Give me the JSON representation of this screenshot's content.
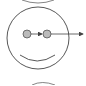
{
  "diagram": {
    "colors": {
      "stroke": "#444444",
      "eye_fill": "#bbbbbb",
      "background": "#ffffff"
    },
    "face": {
      "cx": 38,
      "cy": 38,
      "r": 31
    },
    "eyes": [
      {
        "cx": 27,
        "cy": 34,
        "r": 4
      },
      {
        "cx": 47,
        "cy": 34,
        "r": 4
      }
    ],
    "arrows": [
      {
        "from": "left-eye",
        "to": "right-eye"
      },
      {
        "from": "right-eye",
        "to": "right-edge"
      }
    ],
    "partial_arcs": [
      "top",
      "bottom"
    ]
  }
}
